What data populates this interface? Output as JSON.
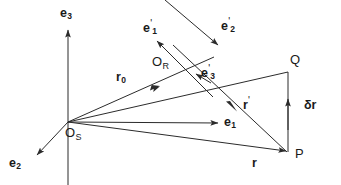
{
  "figure": {
    "type": "vector-diagram",
    "stroke_color": "#2b2b2b",
    "text_color": "#1a1a1a",
    "background": "#ffffff"
  },
  "points": [
    {
      "id": "origin-s",
      "label": "O",
      "subscript": "S",
      "x": 68,
      "y": 122
    },
    {
      "id": "origin-r",
      "label": "O",
      "subscript": "R",
      "x": 185,
      "y": 70
    },
    {
      "id": "point-q",
      "label": "Q",
      "subscript": "",
      "x": 288,
      "y": 72
    },
    {
      "id": "point-p",
      "label": "P",
      "subscript": "",
      "x": 288,
      "y": 152
    }
  ],
  "labels": {
    "e3": {
      "base": "e",
      "sub": "3",
      "prime": ""
    },
    "e2": {
      "base": "e",
      "sub": "2",
      "prime": ""
    },
    "e1": {
      "base": "e",
      "sub": "1",
      "prime": ""
    },
    "e1p": {
      "base": "e",
      "sub": "1",
      "prime": "'"
    },
    "e2p": {
      "base": "e",
      "sub": "2",
      "prime": "'"
    },
    "e3p": {
      "base": "e",
      "sub": "3",
      "prime": "'"
    },
    "r0": {
      "base": "r",
      "sub": "0",
      "prime": ""
    },
    "rprime": {
      "base": "r",
      "sub": "",
      "prime": "'"
    },
    "r": {
      "base": "r",
      "sub": "",
      "prime": ""
    },
    "deltar": {
      "base": "δr",
      "sub": "",
      "prime": ""
    },
    "os": {
      "base": "O",
      "sub": "S",
      "prime": ""
    },
    "or": {
      "base": "O",
      "sub": "R",
      "prime": ""
    },
    "q": {
      "base": "Q",
      "sub": "",
      "prime": ""
    },
    "p": {
      "base": "P",
      "sub": "",
      "prime": ""
    }
  },
  "vectors": [
    {
      "id": "e3-axis",
      "name": "e3-axis-arrow",
      "from": [
        68,
        185
      ],
      "to": [
        68,
        29
      ],
      "arrow": "end",
      "label": "e3"
    },
    {
      "id": "e2-axis",
      "name": "e2-axis-arrow",
      "from": [
        68,
        122
      ],
      "to": [
        36,
        156
      ],
      "arrow": "end",
      "label": "e2"
    },
    {
      "id": "e1-axis",
      "name": "e1-axis-arrow",
      "from": [
        68,
        122
      ],
      "to": [
        219,
        123
      ],
      "arrow": "end",
      "label": "e1"
    },
    {
      "id": "r0-vec",
      "name": "r0-vector",
      "from": [
        68,
        122
      ],
      "to": [
        214,
        57
      ],
      "arrow": "mid",
      "label": "r0"
    },
    {
      "id": "os-q",
      "name": "os-to-q-line",
      "from": [
        68,
        122
      ],
      "to": [
        288,
        72
      ],
      "arrow": "none",
      "label": ""
    },
    {
      "id": "r-vec",
      "name": "r-vector",
      "from": [
        68,
        122
      ],
      "to": [
        288,
        152
      ],
      "arrow": "end",
      "label": "r"
    },
    {
      "id": "rp-vec",
      "name": "r-prime-vector",
      "from": [
        172,
        44
      ],
      "to": [
        288,
        152
      ],
      "arrow": "mid",
      "label": "rprime"
    },
    {
      "id": "e1p-vec",
      "name": "e1-prime-arrow",
      "from": [
        212,
        96
      ],
      "to": [
        156,
        40
      ],
      "arrow": "end",
      "label": "e1p"
    },
    {
      "id": "e2p-vec",
      "name": "e2-prime-arrow",
      "from": [
        166,
        0
      ],
      "to": [
        217,
        44
      ],
      "arrow": "end",
      "label": "e2p"
    },
    {
      "id": "e3p-arrow",
      "name": "e3-prime-arrow",
      "from": [
        212,
        84
      ],
      "to": [
        194,
        73
      ],
      "arrow": "end",
      "label": "e3p"
    },
    {
      "id": "dr-vec",
      "name": "delta-r-vector",
      "from": [
        288,
        152
      ],
      "to": [
        288,
        72
      ],
      "arrow": "end",
      "label": "deltar"
    }
  ],
  "label_positions": {
    "e3": {
      "x": 60,
      "y": 8
    },
    "e2": {
      "x": 10,
      "y": 158
    },
    "e1": {
      "x": 224,
      "y": 116
    },
    "e1p": {
      "x": 143,
      "y": 20
    },
    "e2p": {
      "x": 222,
      "y": 18
    },
    "e3p": {
      "x": 202,
      "y": 66
    },
    "r0": {
      "x": 117,
      "y": 72
    },
    "rprime": {
      "x": 243,
      "y": 98
    },
    "r": {
      "x": 251,
      "y": 158
    },
    "deltar": {
      "x": 305,
      "y": 100
    },
    "os": {
      "x": 66,
      "y": 127
    },
    "or": {
      "x": 153,
      "y": 56
    },
    "q": {
      "x": 290,
      "y": 54
    },
    "p": {
      "x": 295,
      "y": 148
    }
  }
}
